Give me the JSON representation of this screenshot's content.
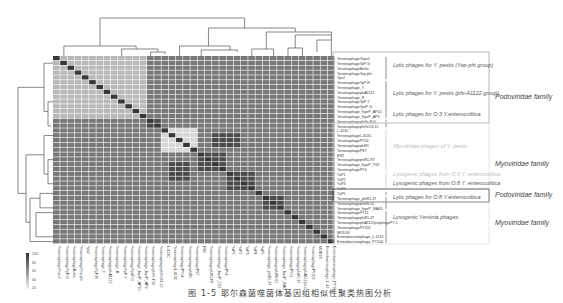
{
  "figure": {
    "caption": "图 1-5  耶尔森菌噬菌体基因组相似性聚类热图分析",
    "colorbar": {
      "ticks": [
        "100",
        "80",
        "60",
        "40",
        "20"
      ],
      "min_color": "#f2f2f2",
      "max_color": "#333333"
    },
    "groups": [
      {
        "label": "Lytic phages for Y. pestis (Yep-phi group)",
        "faded": false
      },
      {
        "label": "Lytic phages for Y. pestis (phi-A1122 group)",
        "faded": false
      },
      {
        "label": "Lytic phages for O:3 Y.enterocolitica",
        "faded": false
      },
      {
        "label": "Myoviridae phages of Y. pestis",
        "faded": true
      },
      {
        "label": "Lysogenic phages from O:3 Y. enterocolitica",
        "faded": true
      },
      {
        "label": "Lysogenic phages from O:8 Y. enterocolitica",
        "faded": false
      },
      {
        "label": "Lytic phages for O:8 Y.enterocolitica",
        "faded": false
      },
      {
        "label": "Lysogenic Yersinia phages",
        "faded": false
      }
    ],
    "families": [
      {
        "label": "Podoviridae family"
      },
      {
        "label": "Myoviridae family"
      },
      {
        "label": "Podoviridae family"
      },
      {
        "label": "Myoviridae family"
      }
    ]
  },
  "chart_data": {
    "type": "heatmap",
    "xlabel": "",
    "ylabel": "",
    "value_range": [
      0,
      100
    ],
    "colorbar_ticks": [
      100,
      80,
      60,
      40,
      20
    ],
    "dendrogram_top": true,
    "dendrogram_left": true,
    "rows": [
      "YersiniaphageYepe2",
      "YersiniaphageYpP-G",
      "YersiniaphageBerlin",
      "YersiniaphageYep-phi",
      "Yps2",
      "YersiniaphageYpP-R",
      "Yersiniaphage_Y",
      "YersiniaphagephiA1122",
      "Yersiniaphage_R",
      "YersiniaphageYpP-Y",
      "YersiniaphageYpsP-G",
      "Yersiniaphage_fsyeP_AP10",
      "Yersiniaphage_fsyeP_AP9",
      "YersiniaphagephiYe-F10",
      "YersiniaphagephiYeO3-12",
      "L-413C",
      "YersiniaphageL-413C",
      "YersiniaphagePY54",
      "YersiniaphagephiR1",
      "YersiniaphagePST",
      "ER2",
      "YersiniaphagephiR1-RT",
      "Yersiniaphage_fsyeP_TG1",
      "YersiniaphagePY4",
      "YaP1",
      "YaP2",
      "YaP3",
      "YaP4",
      "YaP5",
      "Yersiniaphage_phiR1-37",
      "YersiniaphagephiR8-01",
      "Yersiniaphage_fsyeP_SIA05",
      "YersiniaphagePY51",
      "YersiniaphagephiR1-37",
      "YersiniaphagephiA1122prophagePY-1",
      "YersiniaphagePY202",
      "MOD18",
      "Enterobacteriophage_L-413C",
      "Enterobacteriophage_PY100"
    ],
    "row_groups": [
      {
        "group": "Lytic phages for Y. pestis (Yep-phi group)",
        "rows": [
          0,
          4
        ],
        "family": "Podoviridae family"
      },
      {
        "group": "Lytic phages for Y. pestis (phi-A1122 group)",
        "rows": [
          5,
          12
        ],
        "family": "Podoviridae family"
      },
      {
        "group": "Lytic phages for O:3 Y.enterocolitica",
        "rows": [
          13,
          14
        ],
        "family": "Podoviridae family"
      },
      {
        "group": "Myoviridae phages of Y. pestis",
        "rows": [
          15,
          23
        ],
        "family": "Myoviridae family"
      },
      {
        "group": "Lysogenic phages from O:3 Y. enterocolitica",
        "rows": [
          24,
          27
        ],
        "family": "Myoviridae family"
      },
      {
        "group": "Lysogenic phages from O:8 Y. enterocolitica",
        "rows": [
          28,
          28
        ],
        "family": "Myoviridae family"
      },
      {
        "group": "Lytic phages for O:8 Y.enterocolitica",
        "rows": [
          29,
          31
        ],
        "family": "Podoviridae family"
      },
      {
        "group": "Lysogenic Yersinia phages",
        "rows": [
          32,
          38
        ],
        "family": "Myoviridae family"
      }
    ],
    "blocks": [
      {
        "rows": [
          0,
          4
        ],
        "cols": [
          0,
          4
        ],
        "value": 90
      },
      {
        "rows": [
          5,
          12
        ],
        "cols": [
          5,
          12
        ],
        "value": 88
      },
      {
        "rows": [
          0,
          12
        ],
        "cols": [
          0,
          12
        ],
        "value": 40
      },
      {
        "rows": [
          13,
          14
        ],
        "cols": [
          13,
          14
        ],
        "value": 85
      },
      {
        "rows": [
          15,
          19
        ],
        "cols": [
          15,
          19
        ],
        "value": 30
      },
      {
        "rows": [
          16,
          18
        ],
        "cols": [
          22,
          25
        ],
        "value": 85
      },
      {
        "rows": [
          20,
          23
        ],
        "cols": [
          20,
          23
        ],
        "value": 88
      },
      {
        "rows": [
          24,
          27
        ],
        "cols": [
          24,
          27
        ],
        "value": 92
      },
      {
        "rows": [
          29,
          31
        ],
        "cols": [
          29,
          31
        ],
        "value": 90
      }
    ],
    "background_value": 70,
    "diagonal_value": 100
  }
}
